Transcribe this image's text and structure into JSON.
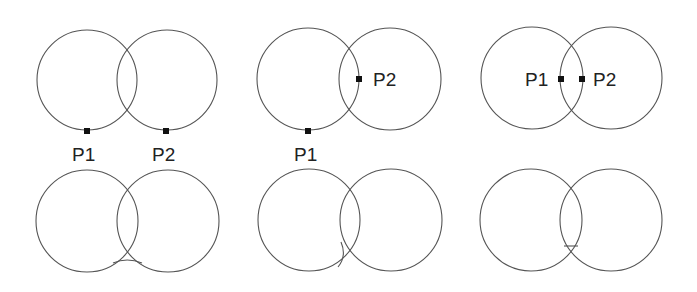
{
  "diagram": {
    "top_row": [
      {
        "panel": 1,
        "circles": [
          {
            "cx": 87,
            "cy": 80,
            "r": 50
          },
          {
            "cx": 167,
            "cy": 80,
            "r": 50
          }
        ],
        "points": [
          {
            "label": "P1",
            "x": 87,
            "y": 131,
            "label_x": 72,
            "label_y": 161
          },
          {
            "label": "P2",
            "x": 166,
            "y": 131,
            "label_x": 152,
            "label_y": 161
          }
        ]
      },
      {
        "panel": 2,
        "circles": [
          {
            "cx": 308,
            "cy": 79,
            "r": 51
          },
          {
            "cx": 390,
            "cy": 79,
            "r": 51
          }
        ],
        "points": [
          {
            "label": "P1",
            "x": 308,
            "y": 131,
            "label_x": 294,
            "label_y": 161
          },
          {
            "label": "P2",
            "x": 359,
            "y": 79,
            "label_x": 373,
            "label_y": 86
          }
        ]
      },
      {
        "panel": 3,
        "circles": [
          {
            "cx": 532,
            "cy": 78,
            "r": 51
          },
          {
            "cx": 611,
            "cy": 78,
            "r": 51
          }
        ],
        "points": [
          {
            "label": "P1",
            "x": 561,
            "y": 79,
            "label_x": 525,
            "label_y": 86
          },
          {
            "label": "P2",
            "x": 582,
            "y": 79,
            "label_x": 593,
            "label_y": 86
          }
        ]
      }
    ],
    "bottom_row": [
      {
        "panel": 1,
        "circles": [
          {
            "cx": 87,
            "cy": 221,
            "r": 51
          },
          {
            "cx": 168,
            "cy": 221,
            "r": 51
          }
        ]
      },
      {
        "panel": 2,
        "circles": [
          {
            "cx": 309,
            "cy": 220,
            "r": 51
          },
          {
            "cx": 391,
            "cy": 220,
            "r": 51
          }
        ]
      },
      {
        "panel": 3,
        "circles": [
          {
            "cx": 531,
            "cy": 220,
            "r": 51
          },
          {
            "cx": 611,
            "cy": 220,
            "r": 51
          }
        ]
      }
    ],
    "labels": {
      "p1": "P1",
      "p2": "P2"
    }
  }
}
